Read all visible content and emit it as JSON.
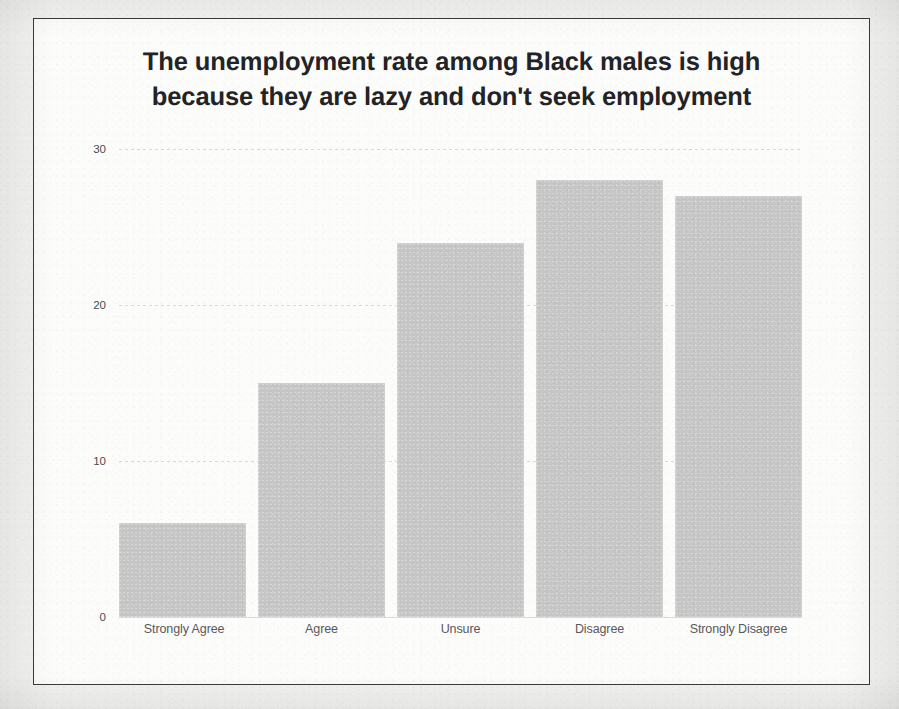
{
  "figure": {
    "title_line_1": "The unemployment rate among Black males is high",
    "title_line_2": "because they are lazy and don't seek employment",
    "frame_color": "#3a3a3c",
    "background_color": "#fcfcfb",
    "bar_color": "#c6c6c6",
    "gridline_color": "#d9d9d6",
    "tick_label_color": "#4c4c4e",
    "category_label_color": "#59595b"
  },
  "chart_data": {
    "type": "bar",
    "title": "The unemployment rate among Black males is high because they are lazy and don't seek employment",
    "xlabel": "",
    "ylabel": "",
    "categories": [
      "Strongly Agree",
      "Agree",
      "Unsure",
      "Disagree",
      "Strongly Disagree"
    ],
    "values": [
      6,
      15,
      24,
      28,
      27
    ],
    "ylim": [
      0,
      30
    ],
    "yticks": [
      0,
      10,
      20,
      30
    ],
    "ytick_labels": [
      "0",
      "10",
      "20",
      "30"
    ],
    "grid": true,
    "grid_axis": "y",
    "legend": false,
    "legend_position": "none",
    "series": [
      {
        "name": "Responses",
        "values": [
          6,
          15,
          24,
          28,
          27
        ]
      }
    ]
  }
}
